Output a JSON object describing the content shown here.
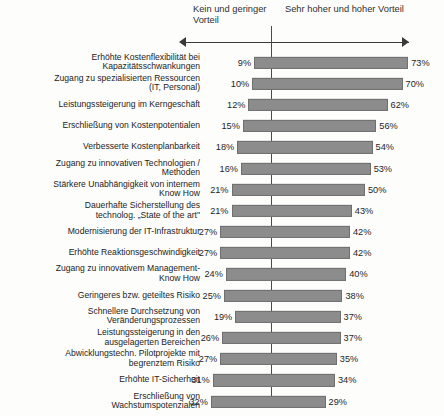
{
  "header": {
    "left_label": "Kein und geringer\nVorteil",
    "right_label": "Sehr hoher und hoher Vorteil",
    "axis_icon": "double-headed-arrow"
  },
  "chart_data": {
    "type": "bar",
    "title": "",
    "subtitle": "",
    "xlabel": "",
    "ylabel": "",
    "orientation": "horizontal",
    "layout": "diverging",
    "grid": false,
    "legend_position": "top",
    "axis_zero_label": "0%",
    "xlim": [
      -40,
      80
    ],
    "categories": [
      "Erhöhte Kostenflexibilität bei\nKapazitätsschwankungen",
      "Zugang zu spezialisierten Ressourcen\n(IT, Personal)",
      "Leistungssteigerung im Kerngeschäft",
      "Erschließung von Kostenpotentialen",
      "Verbesserte Kostenplanbarkeit",
      "Zugang zu innovativen Technologien /\nMethoden",
      "Stärkere Unabhängigkeit von internem\nKnow How",
      "Dauerhafte Sicherstellung des\ntechnolog. „State of the art\"",
      "Modernisierung der IT-Infrastruktur",
      "Erhöhte Reaktionsgeschwindigkeit",
      "Zugang zu innovativem Management-\nKnow How",
      "Geringeres bzw. geteiltes Risiko",
      "Schnellere Durchsetzung von\nVeränderungsprozessen",
      "Leistungssteigerung in den\nausgelagerten Bereichen",
      "Abwicklungstechn. Pilotprojekte mit\nbegrenztem Risiko",
      "Erhöhte IT-Sicherheit",
      "Erschließung von\nWachstumspotenzialen"
    ],
    "series": [
      {
        "name": "Kein und geringer Vorteil",
        "values": [
          9,
          10,
          12,
          15,
          18,
          16,
          21,
          21,
          27,
          27,
          24,
          25,
          19,
          26,
          27,
          31,
          32
        ],
        "labels": [
          "9%",
          "10%",
          "12%",
          "15%",
          "18%",
          "16%",
          "21%",
          "21%",
          "27%",
          "27%",
          "24%",
          "25%",
          "19%",
          "26%",
          "27%",
          "31%",
          "32%"
        ]
      },
      {
        "name": "Sehr hoher und hoher Vorteil",
        "values": [
          73,
          70,
          62,
          56,
          54,
          53,
          50,
          43,
          42,
          42,
          40,
          38,
          37,
          37,
          35,
          34,
          29
        ],
        "labels": [
          "73%",
          "70%",
          "62%",
          "56%",
          "54%",
          "53%",
          "50%",
          "43%",
          "42%",
          "42%",
          "40%",
          "38%",
          "37%",
          "37%",
          "35%",
          "34%",
          "29%"
        ]
      }
    ],
    "bar_color": "#8c8c8c"
  }
}
